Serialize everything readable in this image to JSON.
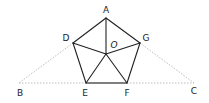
{
  "diagram": {
    "title": "",
    "shape": "regular pentagon ADEFG with center O and extended base BC",
    "points": {
      "A": {
        "label": "A",
        "x": 106,
        "y": 18,
        "lx": 106,
        "ly": 13
      },
      "D": {
        "label": "D",
        "x": 73,
        "y": 43,
        "lx": 66,
        "ly": 41
      },
      "G": {
        "label": "G",
        "x": 140,
        "y": 43,
        "lx": 146,
        "ly": 41
      },
      "E": {
        "label": "E",
        "x": 86,
        "y": 83,
        "lx": 85,
        "ly": 96
      },
      "F": {
        "label": "F",
        "x": 127,
        "y": 83,
        "lx": 127,
        "ly": 96
      },
      "O": {
        "label": "O",
        "x": 106,
        "y": 54,
        "lx": 114,
        "ly": 48
      },
      "B": {
        "label": "B",
        "x": 19,
        "y": 83,
        "lx": 20,
        "ly": 96
      },
      "C": {
        "label": "C",
        "x": 194,
        "y": 83,
        "lx": 194,
        "ly": 94
      }
    },
    "labels": {
      "A": "A",
      "B": "B",
      "C": "C",
      "D": "D",
      "E": "E",
      "F": "F",
      "G": "G",
      "O": "O"
    },
    "solid_segments": [
      "AD",
      "AG",
      "DE",
      "GF",
      "AO",
      "DO",
      "GO",
      "EO",
      "FO"
    ],
    "bold_segments": [
      "EF"
    ],
    "dashed_segments": [
      "BD",
      "GC",
      "BE",
      "FC"
    ],
    "colors": {
      "line": "#222222",
      "base": "#555555",
      "dashed": "#bdbdbd",
      "text": "#222222",
      "background": "#ffffff"
    }
  }
}
